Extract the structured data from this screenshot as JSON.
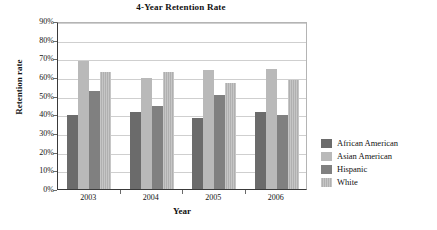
{
  "chart_data": {
    "type": "bar",
    "title": "4-Year Retention Rate",
    "xlabel": "Year",
    "ylabel": "Retention rate",
    "categories": [
      "2003",
      "2004",
      "2005",
      "2006"
    ],
    "series": [
      {
        "name": "African American",
        "color": "#6b6b6b",
        "values": [
          39.5,
          41.0,
          38.0,
          41.5
        ]
      },
      {
        "name": "Asian American",
        "color": "#b9b9b9",
        "values": [
          68.5,
          59.5,
          63.5,
          64.5
        ]
      },
      {
        "name": "Hispanic",
        "color": "#808080",
        "values": [
          52.5,
          44.5,
          50.5,
          39.5
        ]
      },
      {
        "name": "White",
        "color": "#c0c0c0",
        "values": [
          62.5,
          62.5,
          57.0,
          58.5
        ]
      }
    ],
    "ylim": [
      0,
      90
    ],
    "ytick_labels": [
      "90%",
      "80%",
      "70%",
      "60%",
      "50%",
      "40%",
      "30%",
      "20%",
      "10%",
      "0%"
    ],
    "ytick_values": [
      90,
      80,
      70,
      60,
      50,
      40,
      30,
      20,
      10,
      0
    ],
    "grid": true,
    "legend_position": "right"
  }
}
